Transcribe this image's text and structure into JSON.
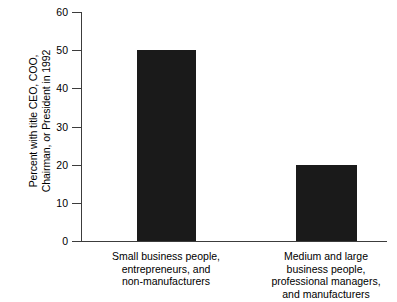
{
  "chart_data": {
    "type": "bar",
    "title": "",
    "xlabel": "",
    "ylabel": "Percent with title CEO, COO, Chairman, or President in 1992",
    "ylabel_lines": [
      "Percent with title CEO, COO,",
      "Chairman, or President in 1992"
    ],
    "categories": [
      "Small business people, entrepreneurs, and non-manufacturers",
      "Medium and large business people, professional managers, and manufacturers"
    ],
    "category_lines": [
      [
        "Small business people,",
        "entrepreneurs, and",
        "non-manufacturers"
      ],
      [
        "Medium and large",
        "business people,",
        "professional managers,",
        "and manufacturers"
      ]
    ],
    "values": [
      50,
      20
    ],
    "ylim": [
      0,
      60
    ],
    "yticks": [
      0,
      10,
      20,
      30,
      40,
      50,
      60
    ],
    "ytick_labels": [
      "0",
      "10",
      "20",
      "30",
      "40",
      "50",
      "60"
    ],
    "grid": false,
    "legend": false,
    "bar_color": "#1a1a1a",
    "axis_color": "#3c3c3c",
    "background_color": "#ffffff"
  }
}
